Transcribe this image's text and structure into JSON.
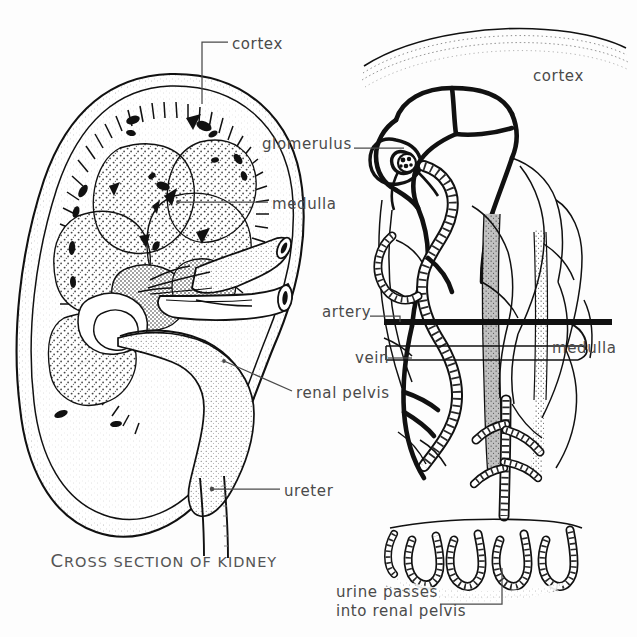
{
  "figure": {
    "title_caption": "CROSS SECTION OF KIDNEY",
    "caption_first_letter": "C",
    "caption_rest": "ROSS SECTION OF KIDNEY",
    "background_color": "#fdfdfd",
    "ink_color": "#111111",
    "label_color": "#4a4a4a",
    "stipple_color": "#6b6b6b"
  },
  "left_panel": {
    "name": "cross-section-of-kidney",
    "labels": [
      {
        "key": "cortex",
        "text": "cortex",
        "x": 232,
        "y": 36,
        "leader": "elbow-down-left"
      },
      {
        "key": "medulla",
        "text": "medulla",
        "x": 272,
        "y": 196,
        "leader": "horizontal-left"
      },
      {
        "key": "renal_pelvis",
        "text": "renal pelvis",
        "x": 296,
        "y": 385,
        "leader": "diagonal-up-left"
      },
      {
        "key": "ureter",
        "text": "ureter",
        "x": 284,
        "y": 483,
        "leader": "horizontal-left-dot"
      }
    ]
  },
  "right_panel": {
    "name": "nephron-detail",
    "labels": [
      {
        "key": "cortex",
        "text": "cortex",
        "x": 533,
        "y": 68,
        "leader": "none"
      },
      {
        "key": "glomerulus",
        "text": "glomerulus",
        "x": 262,
        "y": 136,
        "leader": "horizontal-right"
      },
      {
        "key": "artery",
        "text": "artery",
        "x": 322,
        "y": 304,
        "leader": "horizontal-right"
      },
      {
        "key": "vein",
        "text": "vein",
        "x": 355,
        "y": 350,
        "leader": "horizontal-right"
      },
      {
        "key": "medulla",
        "text": "medulla",
        "x": 552,
        "y": 340,
        "leader": "none"
      },
      {
        "key": "urine_passes",
        "text": "urine passes\ninto renal pelvis",
        "x": 336,
        "y": 587,
        "leader": "right-then-up"
      }
    ]
  }
}
